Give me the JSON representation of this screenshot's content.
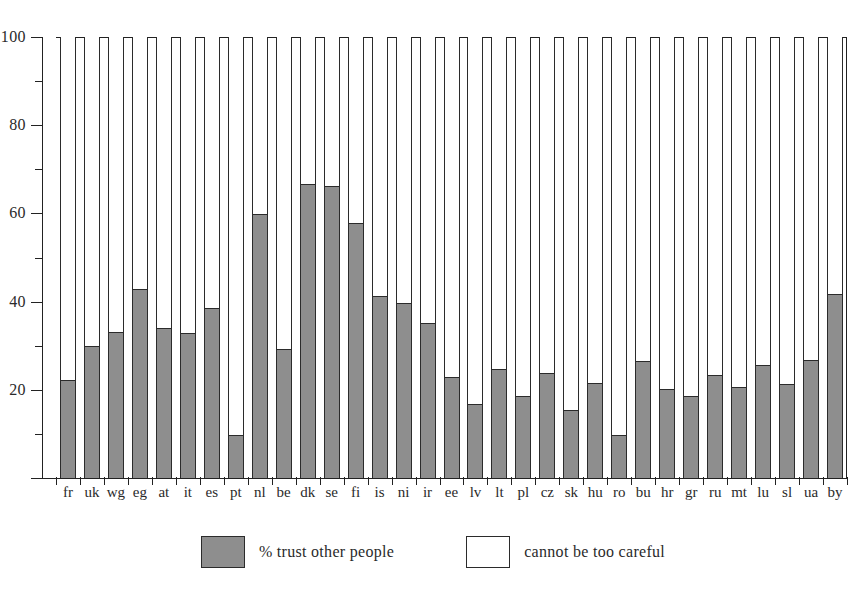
{
  "chart_data": {
    "type": "bar",
    "title": "",
    "subtitle": "",
    "xlabel": "",
    "ylabel": "",
    "ylim": [
      0,
      100
    ],
    "xlim_note": "33 stacked bars, one per country code",
    "grid": false,
    "stacked": true,
    "y_major_ticks": [
      0,
      20,
      40,
      60,
      80,
      100
    ],
    "y_major_tick_labels": [
      "",
      "20",
      "40",
      "60",
      "80",
      "100"
    ],
    "y_minor_ticks": [
      10,
      30,
      50,
      70,
      90
    ],
    "legend_position": "bottom-center",
    "categories": [
      "fr",
      "uk",
      "wg",
      "eg",
      "at",
      "it",
      "es",
      "pt",
      "nl",
      "be",
      "dk",
      "se",
      "fi",
      "is",
      "ni",
      "ir",
      "ee",
      "lv",
      "lt",
      "pl",
      "cz",
      "sk",
      "hu",
      "ro",
      "bu",
      "hr",
      "gr",
      "ru",
      "mt",
      "lu",
      "sl",
      "ua",
      "by"
    ],
    "series": [
      {
        "name": "% trust other people",
        "color": "#8e8e8e",
        "values": [
          22.3,
          30.0,
          33.0,
          42.9,
          34.0,
          32.8,
          38.6,
          9.8,
          59.9,
          29.2,
          66.6,
          66.3,
          57.8,
          41.2,
          39.6,
          35.2,
          22.8,
          16.8,
          24.8,
          18.6,
          23.8,
          15.5,
          21.6,
          9.8,
          26.6,
          20.2,
          18.7,
          23.4,
          20.7,
          25.6,
          21.4,
          26.8,
          41.7
        ]
      },
      {
        "name": "cannot be too careful",
        "color": "#ffffff",
        "values": [
          77.7,
          70.0,
          67.0,
          57.1,
          66.0,
          67.2,
          61.4,
          90.2,
          40.1,
          70.8,
          33.4,
          33.7,
          42.2,
          58.8,
          60.4,
          64.8,
          77.2,
          83.2,
          75.2,
          81.4,
          76.2,
          84.5,
          78.4,
          90.2,
          73.4,
          79.8,
          81.3,
          76.6,
          79.3,
          74.4,
          78.6,
          73.2,
          58.3
        ]
      }
    ]
  },
  "legend": {
    "entries": [
      {
        "label": "% trust other people",
        "swatch": "filled-gray-swatch"
      },
      {
        "label": "cannot be too careful",
        "swatch": "empty-white-swatch"
      }
    ]
  }
}
